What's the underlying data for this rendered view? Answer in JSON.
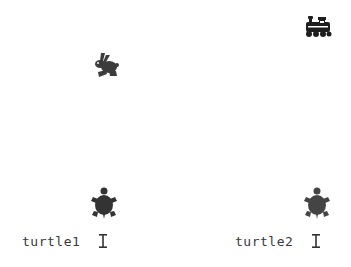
{
  "canvas": {
    "background": "#ffffff",
    "sprites": [
      {
        "name": "rabbit",
        "icon": "rabbit-icon",
        "color": "#3c3c3c"
      },
      {
        "name": "train",
        "icon": "train-icon",
        "color": "#1e1e1e"
      },
      {
        "name": "turtle1",
        "icon": "turtle-icon",
        "color": "#333333"
      },
      {
        "name": "turtle2",
        "icon": "turtle-icon",
        "color": "#444444"
      }
    ]
  },
  "labels": {
    "turtle1": "turtle1",
    "turtle2": "turtle2"
  },
  "cursors": {
    "turtle1": "text-cursor-icon",
    "turtle2": "text-cursor-icon"
  }
}
